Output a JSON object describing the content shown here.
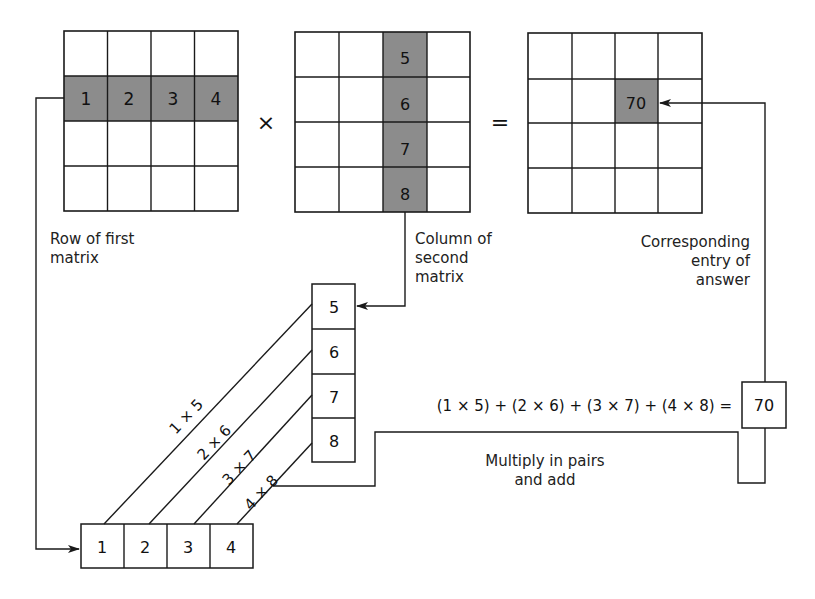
{
  "diagram": {
    "colors": {
      "line": "#1a1a1a",
      "highlight": "#8c8c8c",
      "background": "#ffffff"
    },
    "matrix_a": {
      "rows": 4,
      "cols": 4,
      "highlight_row": 1,
      "values": [
        "1",
        "2",
        "3",
        "4"
      ],
      "label": "Row of first\nmatrix"
    },
    "operator_multiply": "×",
    "matrix_b": {
      "rows": 4,
      "cols": 4,
      "highlight_col": 2,
      "values": [
        "5",
        "6",
        "7",
        "8"
      ],
      "label": "Column of\nsecond\nmatrix"
    },
    "operator_equals": "=",
    "matrix_c": {
      "rows": 4,
      "cols": 4,
      "highlight_row": 1,
      "highlight_col": 2,
      "value": "70",
      "label": "Corresponding\nentry of\nanswer"
    },
    "column_box": [
      "5",
      "6",
      "7",
      "8"
    ],
    "row_box": [
      "1",
      "2",
      "3",
      "4"
    ],
    "products": [
      "1 × 5",
      "2 × 6",
      "3 × 7",
      "4 × 8"
    ],
    "equation": "(1 × 5) + (2 × 6) + (3 × 7) + (4 × 8) =",
    "result": "70",
    "step_label": "Multiply in pairs\nand add"
  }
}
